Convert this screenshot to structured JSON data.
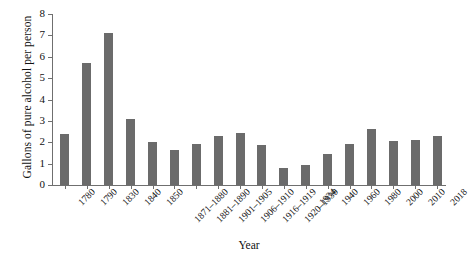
{
  "chart_data": {
    "type": "bar",
    "title": "",
    "xlabel": "Year",
    "ylabel": "Gallons of pure alcohol per person",
    "ylim": [
      0,
      8
    ],
    "yticks": [
      0,
      1,
      2,
      3,
      4,
      5,
      6,
      7,
      8
    ],
    "ytick_labels": [
      "0",
      "1",
      "2",
      "3",
      "4",
      "5",
      "6",
      "7",
      "8"
    ],
    "grid": false,
    "legend": null,
    "bar_color": "#6b6b6b",
    "axis_color": "#6f6f6f",
    "categories": [
      "1780",
      "1790",
      "1830",
      "1840",
      "1850",
      "1871–1880",
      "1881–1890",
      "1901–1905",
      "1906–1910",
      "1916–1919",
      "1920–1930",
      "1934",
      "1940",
      "1960",
      "1980",
      "2000",
      "2010",
      "2018"
    ],
    "values": [
      2.4,
      5.7,
      7.1,
      3.1,
      2.0,
      1.66,
      1.93,
      2.3,
      2.45,
      1.85,
      0.79,
      0.95,
      1.45,
      1.9,
      2.62,
      2.07,
      2.12,
      2.27
    ]
  }
}
